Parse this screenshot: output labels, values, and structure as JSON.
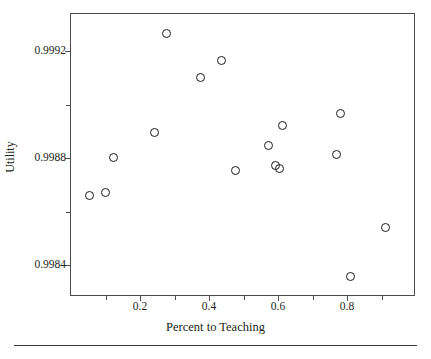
{
  "chart_data": {
    "type": "scatter",
    "title": "",
    "xlabel": "Percent to Teaching",
    "ylabel": "Utility",
    "xlim": [
      0.0,
      1.0
    ],
    "ylim": [
      0.99828,
      0.99934
    ],
    "grid": false,
    "legend": null,
    "marker": "open-circle",
    "xticks": [
      0.2,
      0.4,
      0.6,
      0.8
    ],
    "xtick_labels": [
      "0.2",
      "0.4",
      "0.6",
      "0.8"
    ],
    "x_minor_ticks": [
      0.1,
      0.3,
      0.5,
      0.7,
      0.9
    ],
    "yticks": [
      0.9984,
      0.9988,
      0.9992
    ],
    "ytick_labels": [
      "0.9984",
      "0.9988",
      "0.9992"
    ],
    "y_minor_ticks": [
      0.9986,
      0.999
    ],
    "points": [
      {
        "x": 0.053,
        "y": 0.99866
      },
      {
        "x": 0.101,
        "y": 0.998672
      },
      {
        "x": 0.123,
        "y": 0.998801
      },
      {
        "x": 0.243,
        "y": 0.998898
      },
      {
        "x": 0.277,
        "y": 0.999268
      },
      {
        "x": 0.376,
        "y": 0.999104
      },
      {
        "x": 0.437,
        "y": 0.999164
      },
      {
        "x": 0.477,
        "y": 0.998752
      },
      {
        "x": 0.573,
        "y": 0.998848
      },
      {
        "x": 0.592,
        "y": 0.998772
      },
      {
        "x": 0.603,
        "y": 0.99876
      },
      {
        "x": 0.613,
        "y": 0.998924
      },
      {
        "x": 0.771,
        "y": 0.998812
      },
      {
        "x": 0.781,
        "y": 0.998968
      },
      {
        "x": 0.811,
        "y": 0.998356
      },
      {
        "x": 0.911,
        "y": 0.99854
      }
    ]
  },
  "colors": {
    "marker_stroke": "#1a1a1a",
    "axis": "#4a4a4f",
    "text": "#231f20",
    "background": "#ffffff"
  }
}
